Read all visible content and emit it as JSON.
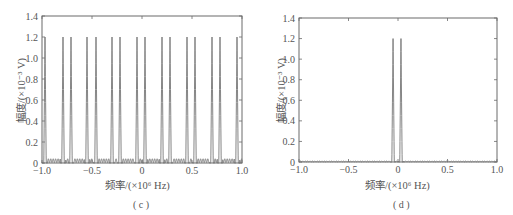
{
  "chart_data": [
    {
      "type": "line",
      "panel_label": "(c)",
      "title": "",
      "xlabel": "频率/(×10⁶ Hz)",
      "ylabel": "幅度/(×10⁻³ V)",
      "xlim": [
        -1.0,
        1.0
      ],
      "ylim": [
        0,
        1.4
      ],
      "xticks": [
        "-1.0",
        "-0.5",
        "0",
        "0.5",
        "1.0"
      ],
      "yticks": [
        "0",
        "0.2",
        "0.4",
        "0.6",
        "0.8",
        "1.0",
        "1.2",
        "1.4"
      ],
      "grid": false,
      "line_color": "#777777",
      "peak_amplitude": 1.2,
      "baseline_ripple": 0.04,
      "peaks_x": [
        -0.97,
        -0.79,
        -0.71,
        -0.55,
        -0.46,
        -0.3,
        -0.22,
        -0.05,
        0.03,
        0.2,
        0.28,
        0.45,
        0.53,
        0.7,
        0.78,
        0.95
      ],
      "series": [
        {
          "name": "spectrum",
          "x": [
            -0.97,
            -0.79,
            -0.71,
            -0.55,
            -0.46,
            -0.3,
            -0.22,
            -0.05,
            0.03,
            0.2,
            0.28,
            0.45,
            0.53,
            0.7,
            0.78,
            0.95
          ],
          "values": [
            1.2,
            1.2,
            1.2,
            1.2,
            1.2,
            1.2,
            1.2,
            1.2,
            1.2,
            1.2,
            1.2,
            1.2,
            1.2,
            1.2,
            1.2,
            1.2
          ]
        }
      ]
    },
    {
      "type": "line",
      "panel_label": "(d)",
      "title": "",
      "xlabel": "频率/(×10⁶ Hz)",
      "ylabel": "幅度/(×10⁻³ V)",
      "xlim": [
        -1.0,
        1.0
      ],
      "ylim": [
        0,
        1.4
      ],
      "xticks": [
        "-1.0",
        "-0.5",
        "0",
        "0.5",
        "1.0"
      ],
      "yticks": [
        "0",
        "0.2",
        "0.4",
        "0.6",
        "0.8",
        "1.0",
        "1.2",
        "1.4"
      ],
      "grid": false,
      "line_color": "#777777",
      "peak_amplitude": 1.2,
      "baseline_ripple": 0.01,
      "peaks_x": [
        -0.05,
        0.03
      ],
      "series": [
        {
          "name": "spectrum",
          "x": [
            -0.05,
            0.03
          ],
          "values": [
            1.2,
            1.2
          ]
        }
      ]
    }
  ],
  "labels": {
    "c": {
      "xlabel": "频率/(×10⁶ Hz)",
      "ylabel": "幅度/(×10⁻³ V)",
      "caption": "( c )"
    },
    "d": {
      "xlabel": "频率/(×10⁶ Hz)",
      "ylabel": "幅度/(×10⁻³ V)",
      "caption": "( d )"
    }
  }
}
